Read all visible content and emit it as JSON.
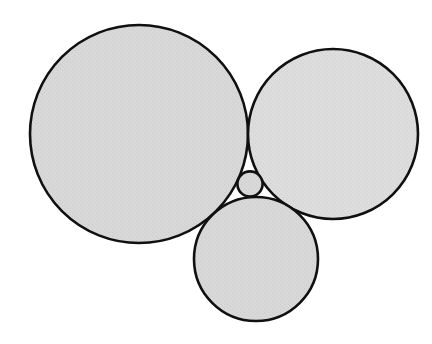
{
  "figure": {
    "background_color": "#ffffff",
    "canvas": {
      "width": 432,
      "height": 344
    }
  },
  "style": {
    "fill_color": "#d8d8d8",
    "stroke_color": "#101010",
    "stroke_width": 2.6,
    "texture_color": "#cfcfcf"
  },
  "chart_data": {
    "type": "diagram",
    "subtype": "tangent-circles",
    "coordinate_system": "pixels, origin top-left",
    "xlim": [
      0,
      432
    ],
    "ylim": [
      0,
      344
    ],
    "grid": false,
    "legend": "none",
    "circles": [
      {
        "name": "large-left-circle",
        "label": "",
        "cx": 139,
        "cy": 134,
        "r": 109,
        "fill": "#d8d8d8",
        "stroke": "#101010"
      },
      {
        "name": "upper-right-circle",
        "label": "",
        "cx": 333,
        "cy": 134,
        "r": 85,
        "fill": "#dcdcdc",
        "stroke": "#101010"
      },
      {
        "name": "bottom-circle",
        "label": "",
        "cx": 256,
        "cy": 259,
        "r": 62,
        "fill": "#d8d8d8",
        "stroke": "#101010"
      },
      {
        "name": "inner-soddy-circle",
        "label": "",
        "cx": 250,
        "cy": 184,
        "r": 12.6,
        "fill": "#cfcfcf",
        "stroke": "#101010"
      }
    ],
    "tangencies": [
      {
        "a": "large-left-circle",
        "b": "upper-right-circle"
      },
      {
        "a": "large-left-circle",
        "b": "bottom-circle"
      },
      {
        "a": "upper-right-circle",
        "b": "bottom-circle"
      },
      {
        "a": "inner-soddy-circle",
        "b": "large-left-circle"
      },
      {
        "a": "inner-soddy-circle",
        "b": "upper-right-circle"
      },
      {
        "a": "inner-soddy-circle",
        "b": "bottom-circle"
      }
    ],
    "annotations": []
  }
}
